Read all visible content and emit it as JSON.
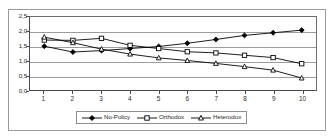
{
  "top_caption": "",
  "chart_data": {
    "type": "line",
    "title": "",
    "subtitle": "",
    "xlabel": "",
    "ylabel": "",
    "categories": [
      "1",
      "2",
      "3",
      "4",
      "5",
      "6",
      "7",
      "8",
      "9",
      "10"
    ],
    "ylim": [
      0.0,
      2.5
    ],
    "ytick_labels": [
      "2,5",
      "2,0",
      "1,5",
      "1,0",
      "0,5",
      "0,0"
    ],
    "ytick_values": [
      2.5,
      2.0,
      1.5,
      1.0,
      0.5,
      0.0
    ],
    "grid": true,
    "grid_axis": "y",
    "legend_position": "bottom",
    "series": [
      {
        "name": "No-Policy",
        "marker": "filled-diamond",
        "color": "#000000",
        "values": [
          1.5,
          1.3,
          1.35,
          1.42,
          1.49,
          1.6,
          1.73,
          1.87,
          1.96,
          2.05
        ]
      },
      {
        "name": "Orthodox",
        "marker": "open-square",
        "color": "#000000",
        "values": [
          1.71,
          1.7,
          1.77,
          1.53,
          1.42,
          1.31,
          1.27,
          1.19,
          1.11,
          0.9
        ]
      },
      {
        "name": "Heterodox",
        "marker": "open-triangle",
        "color": "#000000",
        "values": [
          1.81,
          1.62,
          1.4,
          1.23,
          1.1,
          1.01,
          0.91,
          0.8,
          0.68,
          0.41
        ]
      }
    ]
  }
}
